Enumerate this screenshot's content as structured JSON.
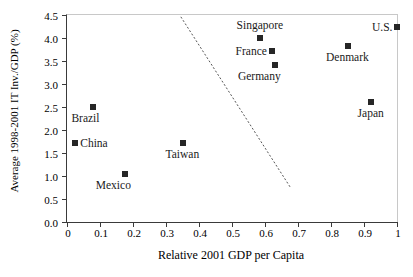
{
  "chart_data": {
    "type": "scatter",
    "title": "",
    "xlabel": "Relative 2001 GDP per Capita",
    "ylabel": "Average 1998-2001 IT Inv./GDP (%)",
    "xlim": [
      0,
      1
    ],
    "ylim": [
      0,
      4.5
    ],
    "xticks": [
      "0",
      "0.1",
      "0.2",
      "0.3",
      "0.4",
      "0.5",
      "0.6",
      "0.7",
      "0.8",
      "0.9",
      "1"
    ],
    "xtick_values": [
      0,
      0.1,
      0.2,
      0.3,
      0.4,
      0.5,
      0.6,
      0.7,
      0.8,
      0.9,
      1
    ],
    "yticks": [
      "0.0",
      "0.5",
      "1.0",
      "1.5",
      "2.0",
      "2.5",
      "3.0",
      "3.5",
      "4.0",
      "4.5"
    ],
    "ytick_values": [
      0.0,
      0.5,
      1.0,
      1.5,
      2.0,
      2.5,
      3.0,
      3.5,
      4.0,
      4.5
    ],
    "grid": false,
    "legend": false,
    "marker_style": "filled-square",
    "marker_color": "#262626",
    "points": [
      {
        "label": "China",
        "x": 0.025,
        "y": 1.71,
        "label_pos": "right"
      },
      {
        "label": "Brazil",
        "x": 0.08,
        "y": 2.49,
        "label_pos": "below-left"
      },
      {
        "label": "Mexico",
        "x": 0.175,
        "y": 1.05,
        "label_pos": "below-left"
      },
      {
        "label": "Taiwan",
        "x": 0.35,
        "y": 1.71,
        "label_pos": "below"
      },
      {
        "label": "Singapore",
        "x": 0.585,
        "y": 3.99,
        "label_pos": "above"
      },
      {
        "label": "France",
        "x": 0.62,
        "y": 3.72,
        "label_pos": "left"
      },
      {
        "label": "Germany",
        "x": 0.63,
        "y": 3.41,
        "label_pos": "below-left"
      },
      {
        "label": "Denmark",
        "x": 0.85,
        "y": 3.83,
        "label_pos": "below"
      },
      {
        "label": "Japan",
        "x": 0.92,
        "y": 2.6,
        "label_pos": "below"
      },
      {
        "label": "U.S.",
        "x": 1.0,
        "y": 4.24,
        "label_pos": "left"
      }
    ],
    "annotations": [
      {
        "type": "dashed-line",
        "name": "frontier-dashed-line",
        "x1": 0.345,
        "y1": 4.46,
        "x2": 0.678,
        "y2": 0.74,
        "color": "#555555",
        "dash": "dotted"
      }
    ]
  }
}
